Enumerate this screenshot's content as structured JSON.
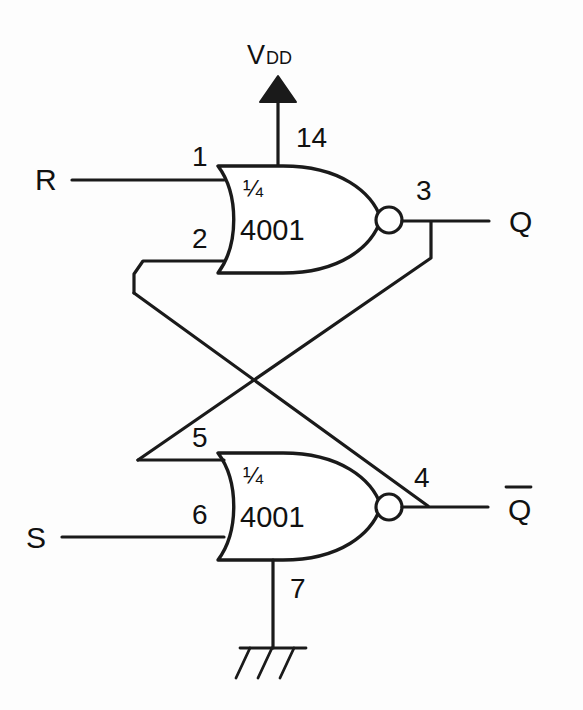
{
  "diagram": {
    "ink_color": "#1a1a1a",
    "background_color": "#fdfdfd"
  },
  "supply": {
    "label": "V",
    "subscript": "DD",
    "symbol": "filled-triangle-up",
    "pin": "14"
  },
  "ground": {
    "pin": "7",
    "symbol": "chassis-ground"
  },
  "inputs": [
    {
      "name": "reset-input",
      "label": "R",
      "pin": "1"
    },
    {
      "name": "set-input",
      "label": "S",
      "pin": "6"
    }
  ],
  "outputs": [
    {
      "name": "q-output",
      "label": "Q",
      "overbar": false,
      "pin": "3"
    },
    {
      "name": "q-not-output",
      "label": "Q",
      "overbar": true,
      "pin": "4"
    }
  ],
  "gates": [
    {
      "name": "nor-gate-top",
      "fraction": "¼",
      "part_number": "4001",
      "type": "NOR",
      "input_pins": [
        "1",
        "2"
      ],
      "output_pin": "3",
      "supply_pin": "14"
    },
    {
      "name": "nor-gate-bottom",
      "fraction": "¼",
      "part_number": "4001",
      "type": "NOR",
      "input_pins": [
        "5",
        "6"
      ],
      "output_pin": "4",
      "ground_pin": "7"
    }
  ],
  "pin_labels": {
    "p1": "1",
    "p2": "2",
    "p3": "3",
    "p4": "4",
    "p5": "5",
    "p6": "6",
    "p7": "7",
    "p14": "14"
  },
  "cross_coupling": {
    "description": "Output 3 feeds input 5; output 4 feeds input 2",
    "crossing_point": "x"
  }
}
